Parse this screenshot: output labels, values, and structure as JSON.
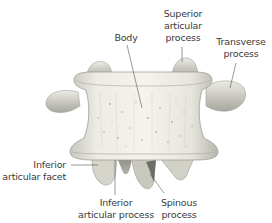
{
  "diagram": {
    "labels": {
      "body": "Body",
      "superior_articular_process": "Superior\narticular\nprocess",
      "transverse_process": "Transverse\nprocess",
      "inferior_articular_facet": "Inferior\narticular facet",
      "inferior_articular_process": "Inferior\narticular process",
      "spinous_process": "Spinous\nprocess"
    },
    "colors": {
      "bone_light": "#f2f1ea",
      "bone_mid": "#d9d8cf",
      "bone_dark": "#8f8e86",
      "label_text": "#3a3a3a",
      "leader_line": "#555555"
    }
  }
}
